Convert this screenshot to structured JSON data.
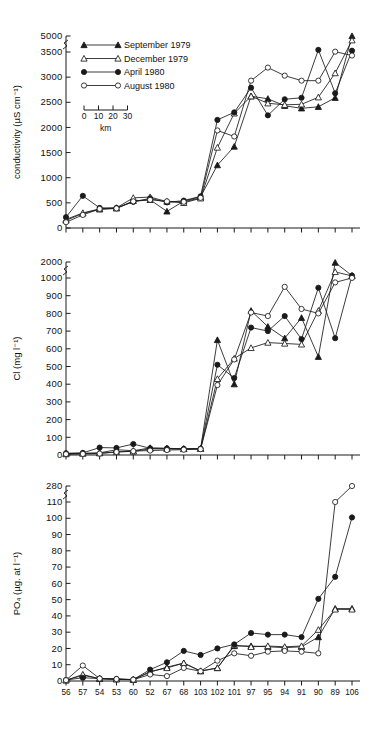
{
  "figure": {
    "xaxis": {
      "label": "",
      "station_labels": [
        "56",
        "57",
        "54",
        "53",
        "60",
        "52",
        "67",
        "68",
        "103",
        "102",
        "101",
        "97",
        "95",
        "94",
        "91",
        "90",
        "89",
        "106"
      ],
      "scalebar": {
        "ticks": [
          "0",
          "10",
          "20",
          "30"
        ],
        "unit": "km"
      }
    },
    "legend": {
      "entries": [
        {
          "label": "September 1979",
          "marker": "filled-triangle"
        },
        {
          "label": "December 1979",
          "marker": "open-triangle"
        },
        {
          "label": "April 1980",
          "marker": "filled-circle"
        },
        {
          "label": "August 1980",
          "marker": "open-circle"
        }
      ]
    }
  },
  "chart_data": [
    {
      "type": "line",
      "title": "",
      "xlabel": "",
      "ylabel": "conductivity (µS cm⁻¹)",
      "categories": [
        "56",
        "57",
        "54",
        "53",
        "60",
        "52",
        "67",
        "68",
        "103",
        "102",
        "101",
        "97",
        "95",
        "94",
        "91",
        "90",
        "89",
        "106"
      ],
      "yticks": [
        0,
        500,
        1000,
        1500,
        2000,
        2500,
        3000,
        3500,
        5000
      ],
      "ylim": [
        0,
        5000
      ],
      "axis_break_between": [
        3500,
        5000
      ],
      "grid": false,
      "legend_position": "top-left",
      "series": [
        {
          "name": "September 1979",
          "marker": "filled-triangle",
          "values": [
            150,
            290,
            370,
            390,
            540,
            560,
            330,
            535,
            620,
            1250,
            1620,
            2620,
            2570,
            2430,
            2380,
            2410,
            2590,
            5000
          ]
        },
        {
          "name": "December 1979",
          "marker": "open-triangle",
          "values": [
            170,
            300,
            380,
            400,
            600,
            615,
            525,
            500,
            590,
            1600,
            2280,
            2620,
            2480,
            2450,
            2460,
            2600,
            3080,
            4600
          ]
        },
        {
          "name": "April 1980",
          "marker": "filled-circle",
          "values": [
            215,
            640,
            400,
            400,
            520,
            590,
            510,
            545,
            630,
            2150,
            2300,
            2790,
            2240,
            2560,
            2590,
            3700,
            2680,
            3620
          ]
        },
        {
          "name": "August 1980",
          "marker": "open-circle",
          "values": [
            115,
            260,
            380,
            390,
            530,
            560,
            530,
            520,
            600,
            1940,
            1820,
            2930,
            3190,
            3030,
            2930,
            2930,
            3530,
            3430
          ]
        }
      ]
    },
    {
      "type": "line",
      "title": "",
      "xlabel": "",
      "ylabel": "Cl (mg l⁻¹)",
      "categories": [
        "56",
        "57",
        "54",
        "53",
        "60",
        "52",
        "67",
        "68",
        "103",
        "102",
        "101",
        "97",
        "95",
        "94",
        "91",
        "90",
        "89",
        "106"
      ],
      "yticks": [
        0,
        100,
        200,
        300,
        400,
        500,
        600,
        700,
        800,
        900,
        1000,
        2000
      ],
      "ylim": [
        0,
        2000
      ],
      "axis_break_between": [
        1000,
        2000
      ],
      "grid": false,
      "legend_position": "none",
      "series": [
        {
          "name": "September 1979",
          "marker": "filled-triangle",
          "values": [
            8,
            10,
            12,
            30,
            24,
            40,
            38,
            35,
            36,
            650,
            400,
            815,
            725,
            660,
            775,
            555,
            1960,
            1150
          ]
        },
        {
          "name": "December 1979",
          "marker": "open-triangle",
          "values": [
            5,
            8,
            10,
            18,
            20,
            35,
            34,
            34,
            35,
            430,
            545,
            605,
            635,
            630,
            625,
            815,
            1380,
            1130
          ]
        },
        {
          "name": "April 1980",
          "marker": "filled-circle",
          "values": [
            10,
            12,
            42,
            40,
            62,
            38,
            37,
            35,
            36,
            510,
            435,
            720,
            700,
            785,
            655,
            945,
            660,
            1150
          ]
        },
        {
          "name": "August 1980",
          "marker": "open-circle",
          "values": [
            5,
            6,
            8,
            17,
            22,
            25,
            28,
            30,
            33,
            395,
            540,
            805,
            785,
            950,
            825,
            800,
            975,
            1005
          ]
        }
      ]
    },
    {
      "type": "line",
      "title": "",
      "xlabel": "",
      "ylabel": "PO₄ (µg. at l⁻¹)",
      "categories": [
        "56",
        "57",
        "54",
        "53",
        "60",
        "52",
        "67",
        "68",
        "103",
        "102",
        "101",
        "97",
        "95",
        "94",
        "91",
        "90",
        "89",
        "106"
      ],
      "yticks": [
        0,
        10,
        20,
        30,
        40,
        50,
        60,
        70,
        80,
        90,
        100,
        110,
        280
      ],
      "ylim": [
        0,
        280
      ],
      "axis_break_between": [
        110,
        280
      ],
      "grid": false,
      "legend_position": "none",
      "series": [
        {
          "name": "September 1979",
          "marker": "filled-triangle",
          "values": [
            0.5,
            3.5,
            1.5,
            1.2,
            0.8,
            5.5,
            8.5,
            11.0,
            6.0,
            8.0,
            21.5,
            21.5,
            21.0,
            20.5,
            21.0,
            27.0,
            44.5,
            44.5
          ]
        },
        {
          "name": "December 1979",
          "marker": "open-triangle",
          "values": [
            0.4,
            4.0,
            1.3,
            1.0,
            0.8,
            5.8,
            8.0,
            11.0,
            6.2,
            8.0,
            22.0,
            21.0,
            21.5,
            21.0,
            21.5,
            31.5,
            44.0,
            44.0
          ]
        },
        {
          "name": "April 1980",
          "marker": "filled-circle",
          "values": [
            0.6,
            2.0,
            1.5,
            1.2,
            0.9,
            7.0,
            11.5,
            18.5,
            16.0,
            20.0,
            22.5,
            29.5,
            28.5,
            28.5,
            27.0,
            50.5,
            64.0,
            100.5
          ]
        },
        {
          "name": "August 1980",
          "marker": "open-circle",
          "values": [
            0.5,
            9.5,
            1.5,
            1.2,
            0.8,
            4.0,
            3.0,
            8.0,
            6.0,
            12.5,
            17.0,
            15.5,
            18.0,
            18.5,
            18.0,
            17.0,
            110.0,
            280.0
          ]
        }
      ]
    }
  ]
}
